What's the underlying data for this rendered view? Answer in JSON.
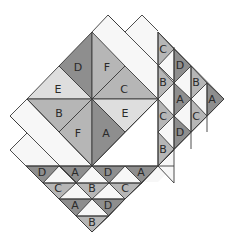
{
  "diagram": {
    "colors": {
      "dark": "#8e8e8e",
      "medium": "#b6b6b6",
      "light": "#dedede",
      "white": "#f7f7f7",
      "stroke": "#3a3a3a"
    },
    "background_bands": [
      {
        "id": "top-band-1",
        "points": "92,32 108,15 174,82 158,99",
        "fill": "white"
      },
      {
        "id": "top-band-2",
        "points": "125,32 142,15 174,47 174,66 158,50 158,66 141,49",
        "fill": "white"
      },
      {
        "id": "right-fill",
        "points": "158,32 174,47 174,183 158,166",
        "fill": "white"
      },
      {
        "id": "left-band-1",
        "points": "27,99 10,116 76,182 92,166",
        "fill": "white"
      },
      {
        "id": "left-band-2",
        "points": "10,150 27,133 59,166 43,166 27,150 43,166",
        "fill": "white"
      },
      {
        "id": "left-band-2b",
        "points": "10,150 27,133 76,182 60,182 43,166 27,166",
        "fill": "white"
      },
      {
        "id": "bottom-fill",
        "points": "27,166 158,166 174,166 158,182 43,182",
        "fill": "white"
      },
      {
        "id": "right-strip-bg",
        "points": "158,32 224,99 158,166",
        "fill": "white"
      },
      {
        "id": "bottom-strip-bg",
        "points": "26,166 158,166 92,232",
        "fill": "white"
      }
    ],
    "pieces": [
      {
        "id": "pinwheel-D",
        "label": "D",
        "shade": "dark",
        "points": "92,32 92,99 59,66"
      },
      {
        "id": "pinwheel-F-top",
        "label": "F",
        "shade": "medium",
        "points": "92,32 125,66 92,99"
      },
      {
        "id": "pinwheel-E-left",
        "label": "E",
        "shade": "light",
        "points": "59,66 92,99 27,99"
      },
      {
        "id": "pinwheel-C",
        "label": "C",
        "shade": "medium",
        "points": "125,66 158,99 92,99"
      },
      {
        "id": "pinwheel-B",
        "label": "B",
        "shade": "medium",
        "points": "27,99 92,99 59,132"
      },
      {
        "id": "pinwheel-E-right",
        "label": "E",
        "shade": "light",
        "points": "158,99 125,132 92,99"
      },
      {
        "id": "pinwheel-F-bottom",
        "label": "F",
        "shade": "medium",
        "points": "59,132 92,99 92,166"
      },
      {
        "id": "pinwheel-A",
        "label": "A",
        "shade": "dark",
        "points": "92,99 125,132 92,166"
      },
      {
        "id": "right-c1-C",
        "label": "C",
        "shade": "medium",
        "points": "158,32 174,49 158,66"
      },
      {
        "id": "right-c1-B",
        "label": "B",
        "shade": "medium",
        "points": "158,66 174,83 158,99"
      },
      {
        "id": "right-c1-C2",
        "label": "C",
        "shade": "medium",
        "points": "158,99 174,116 158,132"
      },
      {
        "id": "right-c1-B2",
        "label": "B",
        "shade": "medium",
        "points": "158,132 174,149 158,166"
      },
      {
        "id": "right-c2-D",
        "label": "D",
        "shade": "dark",
        "points": "174,49 191,66 174,83"
      },
      {
        "id": "right-c2-A",
        "label": "A",
        "shade": "dark",
        "points": "174,83 191,99 174,116"
      },
      {
        "id": "right-c2-D2",
        "label": "D",
        "shade": "dark",
        "points": "174,116 191,132 174,149"
      },
      {
        "id": "right-c3-B",
        "label": "B",
        "shade": "medium",
        "points": "191,66 207,83 191,99"
      },
      {
        "id": "right-c3-C",
        "label": "C",
        "shade": "medium",
        "points": "191,99 207,116 191,132"
      },
      {
        "id": "right-c4-A",
        "label": "A",
        "shade": "dark",
        "points": "207,83 224,99 207,116"
      },
      {
        "id": "bottom-r1-D",
        "label": "D",
        "shade": "dark",
        "points": "26,166 59,166 43,183"
      },
      {
        "id": "bottom-r1-A",
        "label": "A",
        "shade": "dark",
        "points": "59,166 92,166 76,183"
      },
      {
        "id": "bottom-r1-D2",
        "label": "D",
        "shade": "dark",
        "points": "92,166 125,166 109,183"
      },
      {
        "id": "bottom-r1-A2",
        "label": "A",
        "shade": "dark",
        "points": "125,166 158,166 142,183"
      },
      {
        "id": "bottom-r2-C",
        "label": "C",
        "shade": "medium",
        "points": "43,183 76,183 59,199"
      },
      {
        "id": "bottom-r2-B",
        "label": "B",
        "shade": "medium",
        "points": "76,183 109,183 92,199"
      },
      {
        "id": "bottom-r2-C2",
        "label": "C",
        "shade": "medium",
        "points": "109,183 142,183 125,199"
      },
      {
        "id": "bottom-r3-A",
        "label": "A",
        "shade": "dark",
        "points": "59,199 92,199 76,216"
      },
      {
        "id": "bottom-r3-D",
        "label": "D",
        "shade": "dark",
        "points": "92,199 125,199 109,216"
      },
      {
        "id": "bottom-r4-B",
        "label": "B",
        "shade": "medium",
        "points": "76,216 109,216 92,232"
      }
    ],
    "labels": [
      {
        "text": "D",
        "x": 78,
        "y": 67
      },
      {
        "text": "F",
        "x": 107,
        "y": 67
      },
      {
        "text": "E",
        "x": 58,
        "y": 89
      },
      {
        "text": "C",
        "x": 124,
        "y": 89
      },
      {
        "text": "B",
        "x": 59,
        "y": 113
      },
      {
        "text": "E",
        "x": 125,
        "y": 113
      },
      {
        "text": "F",
        "x": 78,
        "y": 133
      },
      {
        "text": "A",
        "x": 106,
        "y": 133
      },
      {
        "text": "C",
        "x": 163,
        "y": 49
      },
      {
        "text": "B",
        "x": 163,
        "y": 82
      },
      {
        "text": "C",
        "x": 163,
        "y": 116
      },
      {
        "text": "B",
        "x": 163,
        "y": 149
      },
      {
        "text": "D",
        "x": 180,
        "y": 65
      },
      {
        "text": "A",
        "x": 180,
        "y": 99
      },
      {
        "text": "D",
        "x": 180,
        "y": 132
      },
      {
        "text": "B",
        "x": 196,
        "y": 82
      },
      {
        "text": "C",
        "x": 196,
        "y": 116
      },
      {
        "text": "A",
        "x": 212,
        "y": 99
      },
      {
        "text": "D",
        "x": 42,
        "y": 172
      },
      {
        "text": "A",
        "x": 75,
        "y": 172
      },
      {
        "text": "D",
        "x": 108,
        "y": 172
      },
      {
        "text": "A",
        "x": 141,
        "y": 172
      },
      {
        "text": "C",
        "x": 58,
        "y": 188
      },
      {
        "text": "B",
        "x": 92,
        "y": 188
      },
      {
        "text": "C",
        "x": 125,
        "y": 188
      },
      {
        "text": "A",
        "x": 75,
        "y": 205
      },
      {
        "text": "D",
        "x": 108,
        "y": 205
      },
      {
        "text": "B",
        "x": 92,
        "y": 222
      }
    ],
    "outlines": [
      "92,32 108,15 174,81",
      "125,32 142,15 158,31",
      "108,15 125,32",
      "27,99 10,116 76,182",
      "10,116 27,133",
      "27,133 10,150 26,166",
      "158,32 158,166",
      "174,47 174,183",
      "191,66 191,149",
      "207,83 207,132",
      "158,32 224,99 158,166",
      "26,166 174,166",
      "43,183 142,183",
      "59,199 125,199",
      "76,216 109,216",
      "26,166 92,232 174,150",
      "158,166 174,150",
      "174,183 158,166",
      "92,166 158,99",
      "92,166 27,99"
    ]
  }
}
